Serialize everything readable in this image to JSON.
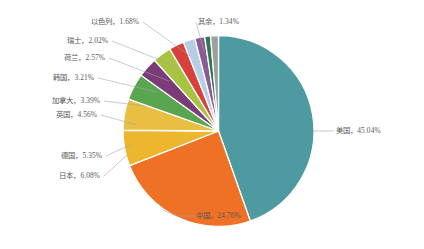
{
  "chart_data": {
    "type": "pie",
    "title": "",
    "subtitle": "",
    "xlabel": "",
    "ylabel": "",
    "legend_position": "none",
    "grid": false,
    "label_format": "{name}，{percent}%",
    "start_angle_deg": 0,
    "direction": "clockwise",
    "categories": [
      "美国",
      "中国",
      "日本",
      "德国",
      "英国",
      "加拿大",
      "韩国",
      "荷兰",
      "瑞士",
      "以色列",
      "其余"
    ],
    "values": [
      45.04,
      24.76,
      6.08,
      5.35,
      4.56,
      3.39,
      3.21,
      2.57,
      2.02,
      1.68,
      1.34
    ],
    "colors": [
      "#4d9aa1",
      "#ef7125",
      "#edb62f",
      "#e8c24a",
      "#5aa550",
      "#7a3b77",
      "#a8c340",
      "#d8403a",
      "#b6cde4",
      "#8c5a96",
      "#2f7a50",
      "#9e9e9e"
    ],
    "slices": [
      {
        "name": "美国",
        "percent": 45.04,
        "label": "美国，45.04%",
        "color": "#4d9aa1"
      },
      {
        "name": "中国",
        "percent": 24.76,
        "label": "中国，24.76%",
        "color": "#ef7125"
      },
      {
        "name": "日本",
        "percent": 6.08,
        "label": "日本，6.08%",
        "color": "#edb62f"
      },
      {
        "name": "德国",
        "percent": 5.35,
        "label": "德国，5.35%",
        "color": "#e8bf42"
      },
      {
        "name": "英国",
        "percent": 4.56,
        "label": "英国，4.56%",
        "color": "#5aa550"
      },
      {
        "name": "加拿大",
        "percent": 3.39,
        "label": "加拿大，3.39%",
        "color": "#7a3b77"
      },
      {
        "name": "韩国",
        "percent": 3.21,
        "label": "韩国，3.21%",
        "color": "#a8c340"
      },
      {
        "name": "荷兰",
        "percent": 2.57,
        "label": "荷兰，2.57%",
        "color": "#d8403a"
      },
      {
        "name": "瑞士",
        "percent": 2.02,
        "label": "瑞士，2.02%",
        "color": "#b6cde4"
      },
      {
        "name": "以色列",
        "percent": 1.68,
        "label": "以色列，1.68%",
        "color": "#8c5a96"
      },
      {
        "name": "其他",
        "percent": 1.0,
        "label": "",
        "color": "#2f7a50"
      },
      {
        "name": "其余",
        "percent": 1.34,
        "label": "其余，1.34%",
        "color": "#9e9e9e"
      }
    ],
    "text_color": "#595959",
    "leader_line_color": "#a6a6a6",
    "slice_border_color": "#ffffff"
  },
  "labels": {
    "us": "美国，45.04%",
    "china": "中国，24.76%",
    "japan": "日本，6.08%",
    "germany": "德国，5.35%",
    "uk": "英国，4.56%",
    "canada": "加拿大，3.39%",
    "korea": "韩国，3.21%",
    "netherlands": "荷兰，2.57%",
    "switzerland": "瑞士，2.02%",
    "israel": "以色列，1.68%",
    "others": "其余，1.34%"
  }
}
